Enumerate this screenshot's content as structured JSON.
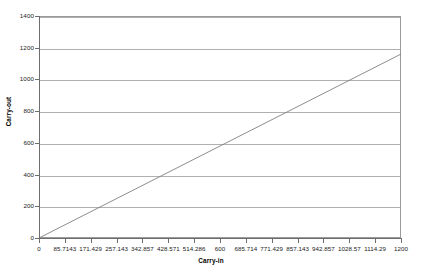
{
  "chart_data": {
    "type": "line",
    "title": "",
    "xlabel": "Carry-in",
    "ylabel": "Carry-out",
    "xlim": [
      0,
      1200
    ],
    "ylim": [
      0,
      1400
    ],
    "grid": true,
    "legend": "none",
    "x_ticks": [
      "0",
      "85.7143",
      "171.429",
      "257.143",
      "342.857",
      "428.571",
      "514.286",
      "600",
      "685.714",
      "771.429",
      "857.143",
      "942.857",
      "1028.57",
      "1114.29",
      "1200"
    ],
    "x_tick_values": [
      0,
      85.7143,
      171.429,
      257.143,
      342.857,
      428.571,
      514.286,
      600,
      685.714,
      771.429,
      857.143,
      942.857,
      1028.57,
      1114.29,
      1200
    ],
    "y_ticks": [
      "0",
      "200",
      "400",
      "600",
      "800",
      "1000",
      "1200",
      "1400"
    ],
    "y_tick_values": [
      0,
      200,
      400,
      600,
      800,
      1000,
      1200,
      1400
    ],
    "series": [
      {
        "name": "carry-out vs carry-in",
        "color": "#808080",
        "x": [
          0,
          1200
        ],
        "values": [
          0,
          1160
        ]
      }
    ]
  },
  "axes": {
    "y_title": "Carry-out",
    "x_title": "Carry-in"
  }
}
